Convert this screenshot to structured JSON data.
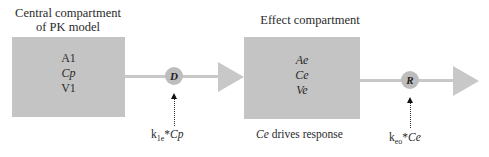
{
  "diagram": {
    "central": {
      "title_line1": "Central compartment",
      "title_line2": "of PK model",
      "vars": [
        "A1",
        "Cp",
        "V1"
      ]
    },
    "effect": {
      "title": "Effect compartment",
      "vars": [
        "Ae",
        "Ce",
        "Ve"
      ],
      "caption_var": "Ce",
      "caption_text": " drives response"
    },
    "node_d": {
      "label": "D",
      "rate_k": "k",
      "rate_sub": "1e",
      "rate_rest": "*",
      "rate_var": "Cp"
    },
    "node_r": {
      "label": "R",
      "rate_k": "k",
      "rate_sub": "eo",
      "rate_rest": "*",
      "rate_var": "Ce"
    },
    "colors": {
      "box": "#c4c4c4",
      "arrow": "#c8c8c8",
      "node": "#bdbdbd"
    }
  }
}
